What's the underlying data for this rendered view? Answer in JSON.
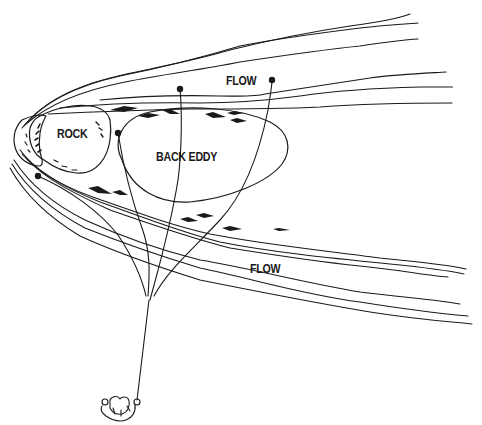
{
  "diagram": {
    "type": "illustration",
    "colors": {
      "ink": "#1a1a1a",
      "background": "#ffffff"
    },
    "labels": [
      {
        "id": "rock",
        "text": "ROCK",
        "x": 57,
        "y": 132
      },
      {
        "id": "back-eddy",
        "text": "BACK EDDY",
        "x": 156,
        "y": 150
      },
      {
        "id": "flow-top",
        "text": "FLOW",
        "x": 226,
        "y": 74
      },
      {
        "id": "flow-bottom",
        "text": "FLOW",
        "x": 250,
        "y": 261
      }
    ],
    "elements": [
      {
        "name": "rock-outline",
        "description": "irregular rock at left tip of current"
      },
      {
        "name": "back-eddy-ellipse",
        "description": "oval area of recirculating water downstream of rock"
      },
      {
        "name": "current-lines",
        "description": "wavy lines showing water flowing left to right around rock"
      },
      {
        "name": "eddy-arrows",
        "description": "solid arrows pointing upstream inside the eddy boundary"
      },
      {
        "name": "rope-lines",
        "description": "ropes fanning out from a single anchor line to points in the water"
      },
      {
        "name": "rope-anchor-dots",
        "description": "black dots marking rope ends"
      },
      {
        "name": "rescuer-figure",
        "description": "person holding the rope at bottom"
      }
    ]
  }
}
